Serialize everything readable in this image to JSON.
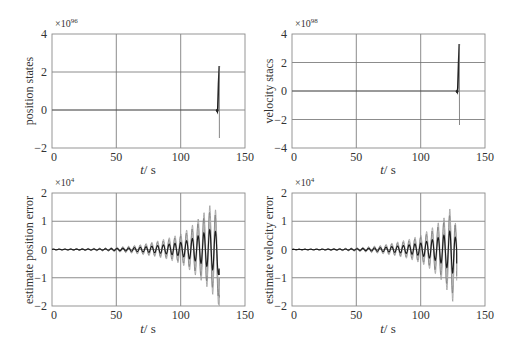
{
  "figure": {
    "width": 514,
    "height": 345,
    "colors": {
      "axis": "#8a8a8a",
      "grid": "#6e6e6e",
      "line_dark": "#1a1a1a",
      "line_light": "#8c8c8c",
      "text": "#333333"
    }
  },
  "chart_data": [
    {
      "type": "line",
      "id": "position-states",
      "title": "",
      "xlabel": "t/s",
      "ylabel": "position states",
      "y_multiplier": "×10",
      "y_exponent": "96",
      "xlim": [
        0,
        150
      ],
      "ylim": [
        -2,
        4
      ],
      "xticks": [
        "0",
        "50",
        "100",
        "150"
      ],
      "yticks": [
        "4",
        "2",
        "0",
        "−2"
      ],
      "grid": true,
      "box": {
        "x0": 52,
        "y0": 34,
        "x1": 245,
        "y1": 148
      },
      "description": "Near-zero until t≈128 s, then diverges: spike to ≈+2.3 and ≈−1.5 (×10^96) at t≈129–130 s",
      "series": [
        {
          "name": "state",
          "x": [
            0,
            127,
            128,
            128.5,
            129,
            129.5,
            130,
            130
          ],
          "y": [
            0,
            0,
            0,
            -0.05,
            0.2,
            1.2,
            2.3,
            -1.5
          ]
        }
      ]
    },
    {
      "type": "line",
      "id": "velocity-states",
      "title": "",
      "xlabel": "t/s",
      "ylabel": "velocity stacs",
      "y_multiplier": "×10",
      "y_exponent": "98",
      "xlim": [
        0,
        150
      ],
      "ylim": [
        -4,
        4
      ],
      "xticks": [
        "0",
        "50",
        "100",
        "150"
      ],
      "yticks": [
        "4",
        "2",
        "0",
        "−2",
        "−4"
      ],
      "grid": true,
      "box": {
        "x0": 292,
        "y0": 34,
        "x1": 485,
        "y1": 148
      },
      "description": "Near-zero until t≈128 s, then spike to ≈+3.3 and ≈−2.4 (×10^98) at t≈129–130 s",
      "series": [
        {
          "name": "state",
          "x": [
            0,
            127,
            128,
            128.5,
            129,
            129.5,
            130,
            130
          ],
          "y": [
            0,
            0,
            0,
            -0.05,
            0.3,
            1.8,
            3.3,
            -2.4
          ]
        }
      ]
    },
    {
      "type": "line",
      "id": "estimate-position-error",
      "title": "",
      "xlabel": "t/s",
      "ylabel": "estimate position error",
      "y_multiplier": "×10",
      "y_exponent": "4",
      "xlim": [
        0,
        150
      ],
      "ylim": [
        -2,
        2
      ],
      "xticks": [
        "0",
        "50",
        "100",
        "150"
      ],
      "yticks": [
        "2",
        "1",
        "0",
        "−1",
        "−2"
      ],
      "grid": true,
      "box": {
        "x0": 52,
        "y0": 193,
        "x1": 245,
        "y1": 306
      },
      "description": "Growing oscillation (period ≈4.5 s) from t≈20 s to t≈130 s; envelope grows to ≈+1.7 / −1.6 (×10^4) near t≈125 s; multiple overlapping traces",
      "envelope": {
        "t": [
          0,
          20,
          40,
          50,
          60,
          70,
          80,
          90,
          100,
          105,
          110,
          115,
          120,
          125,
          130
        ],
        "upper": [
          0.02,
          0.03,
          0.05,
          0.08,
          0.12,
          0.18,
          0.28,
          0.4,
          0.55,
          0.7,
          0.9,
          1.15,
          1.4,
          1.7,
          1.0
        ],
        "lower": [
          -0.02,
          -0.03,
          -0.05,
          -0.08,
          -0.12,
          -0.18,
          -0.25,
          -0.35,
          -0.5,
          -0.65,
          -0.85,
          -1.05,
          -1.3,
          -1.6,
          -2.0
        ]
      },
      "period_s": 4.5,
      "end_t": 130
    },
    {
      "type": "line",
      "id": "estimate-velocity-error",
      "title": "",
      "xlabel": "t/s",
      "ylabel": "estimate  velocity error",
      "y_multiplier": "×10",
      "y_exponent": "4",
      "xlim": [
        0,
        150
      ],
      "ylim": [
        -2,
        2
      ],
      "xticks": [
        "0",
        "50",
        "100",
        "150"
      ],
      "yticks": [
        "2",
        "1",
        "0",
        "−1",
        "−2"
      ],
      "grid": true,
      "box": {
        "x0": 292,
        "y0": 193,
        "x1": 485,
        "y1": 306
      },
      "description": "Growing oscillation (period ≈4.5 s) from t≈20 s to t≈128 s; envelope grows to ≈+1.65 / −1.85 (×10^4) near t≈125 s",
      "envelope": {
        "t": [
          0,
          20,
          40,
          50,
          60,
          70,
          80,
          90,
          100,
          105,
          110,
          115,
          120,
          125,
          128
        ],
        "upper": [
          0.01,
          0.02,
          0.04,
          0.06,
          0.1,
          0.15,
          0.25,
          0.35,
          0.5,
          0.65,
          0.8,
          1.0,
          1.2,
          1.65,
          0.6
        ],
        "lower": [
          -0.01,
          -0.02,
          -0.04,
          -0.06,
          -0.1,
          -0.15,
          -0.22,
          -0.32,
          -0.48,
          -0.6,
          -0.8,
          -1.0,
          -1.4,
          -1.85,
          -1.1
        ]
      },
      "period_s": 4.5,
      "end_t": 128
    }
  ],
  "labels": {
    "p1": {
      "ylabel": "position states",
      "xlabel_t": "t",
      "xlabel_unit": "/ s",
      "mult": "×10",
      "exp": "96",
      "yticks": [
        "4",
        "2",
        "0",
        "−2"
      ],
      "xticks": [
        "0",
        "50",
        "100",
        "150"
      ]
    },
    "p2": {
      "ylabel": "velocity stacs",
      "xlabel_t": "t",
      "xlabel_unit": "/ s",
      "mult": "×10",
      "exp": "98",
      "yticks": [
        "4",
        "2",
        "0",
        "−2",
        "−4"
      ],
      "xticks": [
        "0",
        "50",
        "100",
        "150"
      ]
    },
    "p3": {
      "ylabel": "estimate position error",
      "xlabel_t": "t",
      "xlabel_unit": "/ s",
      "mult": "×10",
      "exp": "4",
      "yticks": [
        "2",
        "1",
        "0",
        "−1",
        "−2"
      ],
      "xticks": [
        "0",
        "50",
        "100",
        "150"
      ]
    },
    "p4": {
      "ylabel": "estimate  velocity error",
      "xlabel_t": "t",
      "xlabel_unit": "/ s",
      "mult": "×10",
      "exp": "4",
      "yticks": [
        "2",
        "1",
        "0",
        "−1",
        "−2"
      ],
      "xticks": [
        "0",
        "50",
        "100",
        "150"
      ]
    }
  }
}
